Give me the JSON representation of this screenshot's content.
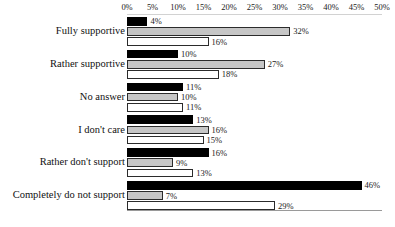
{
  "chart_data": {
    "type": "bar",
    "orientation": "horizontal",
    "title": "",
    "subtitle": "",
    "xlabel": "",
    "ylabel": "",
    "xlim": [
      0,
      50
    ],
    "xunit": "%",
    "grid": false,
    "legend": "none",
    "axis_ticks": [
      "0%",
      "5%",
      "10%",
      "15%",
      "20%",
      "25%",
      "30%",
      "35%",
      "40%",
      "45%",
      "50%"
    ],
    "axis_tick_values": [
      0,
      5,
      10,
      15,
      20,
      25,
      30,
      35,
      40,
      45,
      50
    ],
    "categories": [
      "Fully supportive",
      "Rather supportive",
      "No answer",
      "I don't care",
      "Rather don't support",
      "Completely do not support"
    ],
    "series": [
      {
        "name": "series-1",
        "color": "#000000",
        "values": [
          4,
          10,
          11,
          13,
          16,
          46
        ],
        "labels": [
          "4%",
          "10%",
          "11%",
          "13%",
          "16%",
          "46%"
        ]
      },
      {
        "name": "series-2",
        "color": "#c6c6c6",
        "values": [
          32,
          27,
          10,
          16,
          9,
          7
        ],
        "labels": [
          "32%",
          "27%",
          "10%",
          "16%",
          "9%",
          "7%"
        ]
      },
      {
        "name": "series-3",
        "color": "#ffffff",
        "values": [
          16,
          18,
          11,
          15,
          13,
          29
        ],
        "labels": [
          "16%",
          "18%",
          "11%",
          "15%",
          "13%",
          "29%"
        ]
      }
    ]
  }
}
